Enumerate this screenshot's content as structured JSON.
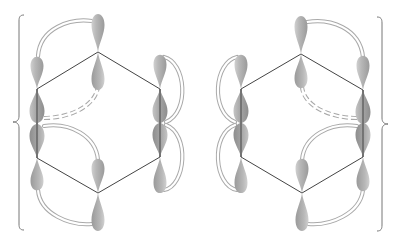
{
  "figure": {
    "bracket_color": "#777777",
    "bond_color": "#444444",
    "orbital_color": "#b0b0b0",
    "pi_overlap_color": "#a9a9a9"
  },
  "structures": [
    {
      "name": "resonance-structure-1",
      "ring_vertices": [
        [
          98,
          52
        ],
        [
          160,
          89
        ],
        [
          160,
          157
        ],
        [
          98,
          193
        ],
        [
          37,
          158
        ],
        [
          37,
          89
        ]
      ],
      "pi_bonds": [
        "top-left vertex to top vertex (solid)",
        "right side vertical (solid)",
        "bottom-left to bottom (solid)"
      ],
      "dashed_overlap": "left-middle to top-center lower lobe"
    },
    {
      "name": "resonance-structure-2",
      "ring_vertices": [
        [
          301,
          54
        ],
        [
          363,
          90
        ],
        [
          363,
          157
        ],
        [
          302,
          193
        ],
        [
          241,
          157
        ],
        [
          241,
          89
        ]
      ],
      "pi_bonds": [
        "top vertex to top-right (solid)",
        "left side vertical (solid)",
        "bottom to bottom-right (solid)"
      ],
      "dashed_overlap": "right-middle to top-center lower lobe"
    }
  ]
}
